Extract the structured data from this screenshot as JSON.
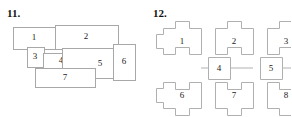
{
  "page": {
    "width": 291,
    "height": 117,
    "background": "#ffffff",
    "line_color": "#a8a8a8",
    "text_color": "#1a1a1a"
  },
  "figures": [
    {
      "number": "11.",
      "name": "overlapping-rectangles-puzzle",
      "type": "overlapping rectangles",
      "cells": [
        {
          "label": "1",
          "x": 13,
          "y": 27,
          "w": 43,
          "h": 22,
          "label_x": 34,
          "label_y": 38
        },
        {
          "label": "2",
          "x": 55,
          "y": 25,
          "w": 63,
          "h": 24,
          "label_x": 86,
          "label_y": 37
        },
        {
          "label": "3",
          "x": 27,
          "y": 47,
          "w": 17,
          "h": 20,
          "label_x": 35,
          "label_y": 57
        },
        {
          "label": "4",
          "x": 43,
          "y": 53,
          "w": 36,
          "h": 15,
          "label_x": 61,
          "label_y": 61
        },
        {
          "label": "5",
          "x": 62,
          "y": 48,
          "w": 56,
          "h": 30,
          "label_x": 100,
          "label_y": 64
        },
        {
          "label": "6",
          "x": 113,
          "y": 44,
          "w": 22,
          "h": 36,
          "label_x": 124,
          "label_y": 62
        },
        {
          "label": "7",
          "x": 35,
          "y": 68,
          "w": 60,
          "h": 19,
          "label_x": 65,
          "label_y": 78
        }
      ]
    },
    {
      "number": "12.",
      "name": "interlocking-jigsaw-grid",
      "type": "jigsaw tiles grid",
      "cells": [
        {
          "label": "1",
          "col": 0,
          "row": 0,
          "size": "large"
        },
        {
          "label": "2",
          "col": 1,
          "row": 0,
          "size": "large"
        },
        {
          "label": "3",
          "col": 2,
          "row": 0,
          "size": "large"
        },
        {
          "label": "4",
          "col": 0,
          "row": 1,
          "size": "small"
        },
        {
          "label": "5",
          "col": 1,
          "row": 1,
          "size": "small"
        },
        {
          "label": "6",
          "col": 0,
          "row": 2,
          "size": "large"
        },
        {
          "label": "7",
          "col": 1,
          "row": 2,
          "size": "large"
        },
        {
          "label": "8",
          "col": 2,
          "row": 2,
          "size": "large"
        }
      ]
    }
  ]
}
